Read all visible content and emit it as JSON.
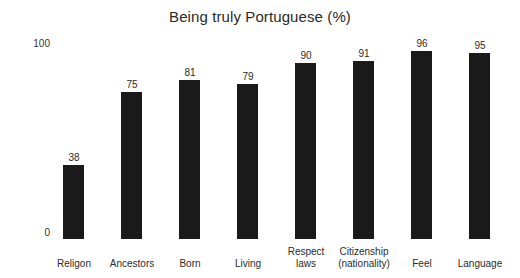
{
  "chart_data": {
    "type": "bar",
    "title": "Being truly Portuguese (%)",
    "xlabel": "",
    "ylabel": "",
    "ylim": [
      0,
      100
    ],
    "yticks": [
      "0",
      "100"
    ],
    "grid": false,
    "legend": "none",
    "bar_color": "#1a1a1a",
    "background_color": "#ffffff",
    "categories": [
      "Religon",
      "Ancestors",
      "Born",
      "Living",
      "Respect laws",
      "Citizenship (nationality)",
      "Feel",
      "Language"
    ],
    "values": [
      38,
      75,
      81,
      79,
      90,
      91,
      96,
      95
    ],
    "bars": [
      {
        "category_lines": [
          "Religon"
        ],
        "value": 38,
        "value_label": "38"
      },
      {
        "category_lines": [
          "Ancestors"
        ],
        "value": 75,
        "value_label": "75"
      },
      {
        "category_lines": [
          "Born"
        ],
        "value": 81,
        "value_label": "81"
      },
      {
        "category_lines": [
          "Living"
        ],
        "value": 79,
        "value_label": "79"
      },
      {
        "category_lines": [
          "Respect",
          "laws"
        ],
        "value": 90,
        "value_label": "90"
      },
      {
        "category_lines": [
          "Citizenship",
          "(nationality)"
        ],
        "value": 91,
        "value_label": "91"
      },
      {
        "category_lines": [
          "Feel"
        ],
        "value": 96,
        "value_label": "96"
      },
      {
        "category_lines": [
          "Language"
        ],
        "value": 95,
        "value_label": "95"
      }
    ]
  },
  "axis": {
    "y_top_label": "100",
    "y_bottom_label": "0"
  }
}
